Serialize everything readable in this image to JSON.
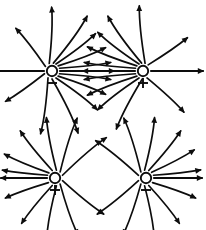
{
  "figure": {
    "background_color": "#ffffff",
    "stroke_color": "#0d0d0d",
    "width": 206,
    "height": 230
  },
  "charges": [
    {
      "id": "charge-top-left",
      "sign": "minus",
      "sign_glyph": "−",
      "label": "negative charge",
      "cx": 52,
      "cy": 71,
      "radius": 5.2,
      "field_direction": "outward",
      "quadrant": "top-left",
      "line_count": 16
    },
    {
      "id": "charge-top-right",
      "sign": "plus",
      "sign_glyph": "+",
      "label": "positive charge",
      "cx": 143,
      "cy": 71,
      "radius": 5.2,
      "field_direction": "outward",
      "quadrant": "top-right",
      "line_count": 13
    },
    {
      "id": "charge-bottom-left",
      "sign": "plus",
      "sign_glyph": "+",
      "label": "positive charge",
      "cx": 55,
      "cy": 178,
      "radius": 5.2,
      "field_direction": "outward",
      "quadrant": "bottom-left",
      "line_count": 12
    },
    {
      "id": "charge-bottom-right",
      "sign": "minus",
      "sign_glyph": "−",
      "label": "negative charge",
      "cx": 146,
      "cy": 178,
      "radius": 5.2,
      "field_direction": "outward",
      "quadrant": "bottom-right",
      "line_count": 12
    }
  ],
  "chart_data": {
    "type": "diagram",
    "series": [
      {
        "name": "top-left negative charge field lines",
        "charge_sign": "minus",
        "center": [
          52,
          71
        ],
        "arrow_direction": "outward",
        "lines": [
          {
            "angle_deg": 180,
            "curvature": 0,
            "length": 50
          },
          {
            "angle_deg": 0,
            "curvature": 0,
            "length": 54
          },
          {
            "angle_deg": 20,
            "curvature": 0.35,
            "length": 50
          },
          {
            "angle_deg": 40,
            "curvature": 0.5,
            "length": 48
          },
          {
            "angle_deg": 60,
            "curvature": 0.6,
            "length": 46
          },
          {
            "angle_deg": 80,
            "curvature": 0.7,
            "length": 52
          },
          {
            "angle_deg": 110,
            "curvature": 0.6,
            "length": 52
          },
          {
            "angle_deg": 145,
            "curvature": 0.45,
            "length": 46
          },
          {
            "angle_deg": 200,
            "curvature": -0.4,
            "length": 46
          },
          {
            "angle_deg": 240,
            "curvature": -0.6,
            "length": 52
          },
          {
            "angle_deg": 270,
            "curvature": -0.7,
            "length": 54
          },
          {
            "angle_deg": 300,
            "curvature": -0.6,
            "length": 48
          },
          {
            "angle_deg": 320,
            "curvature": -0.5,
            "length": 48
          },
          {
            "angle_deg": 340,
            "curvature": -0.35,
            "length": 50
          }
        ]
      },
      {
        "name": "top-right positive charge field lines",
        "charge_sign": "plus",
        "center": [
          143,
          71
        ],
        "arrow_direction": "outward",
        "lines": [
          {
            "angle_deg": 0,
            "curvature": 0,
            "length": 52
          },
          {
            "angle_deg": 180,
            "curvature": 0,
            "length": 52
          },
          {
            "angle_deg": 160,
            "curvature": -0.35,
            "length": 50
          },
          {
            "angle_deg": 140,
            "curvature": -0.5,
            "length": 50
          },
          {
            "angle_deg": 120,
            "curvature": -0.6,
            "length": 48
          },
          {
            "angle_deg": 100,
            "curvature": -0.7,
            "length": 52
          },
          {
            "angle_deg": 75,
            "curvature": -0.55,
            "length": 54
          },
          {
            "angle_deg": 50,
            "curvature": 0.4,
            "length": 46
          },
          {
            "angle_deg": 200,
            "curvature": 0.35,
            "length": 50
          },
          {
            "angle_deg": 220,
            "curvature": 0.5,
            "length": 50
          },
          {
            "angle_deg": 240,
            "curvature": 0.6,
            "length": 48
          },
          {
            "angle_deg": 265,
            "curvature": 0.6,
            "length": 52
          },
          {
            "angle_deg": 300,
            "curvature": -0.45,
            "length": 48
          }
        ]
      },
      {
        "name": "bottom-left positive charge field lines",
        "charge_sign": "plus",
        "center": [
          55,
          178
        ],
        "arrow_direction": "outward",
        "lines": [
          {
            "angle_deg": 180,
            "curvature": 0,
            "length": 46
          },
          {
            "angle_deg": 160,
            "curvature": -0.35,
            "length": 44
          },
          {
            "angle_deg": 140,
            "curvature": -0.45,
            "length": 46
          },
          {
            "angle_deg": 110,
            "curvature": -0.5,
            "length": 48
          },
          {
            "angle_deg": 80,
            "curvature": -0.55,
            "length": 50
          },
          {
            "angle_deg": 50,
            "curvature": -0.6,
            "length": 52
          },
          {
            "angle_deg": 20,
            "curvature": -0.55,
            "length": 54
          },
          {
            "angle_deg": 340,
            "curvature": 0.5,
            "length": 50
          },
          {
            "angle_deg": 310,
            "curvature": 0.55,
            "length": 50
          },
          {
            "angle_deg": 280,
            "curvature": 0.55,
            "length": 48
          },
          {
            "angle_deg": 250,
            "curvature": 0.5,
            "length": 46
          },
          {
            "angle_deg": 215,
            "curvature": 0.4,
            "length": 44
          }
        ]
      },
      {
        "name": "bottom-right negative charge field lines",
        "charge_sign": "minus",
        "center": [
          146,
          178
        ],
        "arrow_direction": "outward",
        "lines": [
          {
            "angle_deg": 0,
            "curvature": 0,
            "length": 48
          },
          {
            "angle_deg": 20,
            "curvature": 0.35,
            "length": 46
          },
          {
            "angle_deg": 45,
            "curvature": 0.45,
            "length": 46
          },
          {
            "angle_deg": 70,
            "curvature": 0.5,
            "length": 48
          },
          {
            "angle_deg": 100,
            "curvature": 0.55,
            "length": 50
          },
          {
            "angle_deg": 130,
            "curvature": 0.6,
            "length": 52
          },
          {
            "angle_deg": 160,
            "curvature": 0.5,
            "length": 52
          },
          {
            "angle_deg": 200,
            "curvature": -0.5,
            "length": 50
          },
          {
            "angle_deg": 230,
            "curvature": -0.55,
            "length": 50
          },
          {
            "angle_deg": 260,
            "curvature": -0.55,
            "length": 48
          },
          {
            "angle_deg": 290,
            "curvature": -0.5,
            "length": 46
          },
          {
            "angle_deg": 325,
            "curvature": -0.4,
            "length": 44
          }
        ]
      }
    ]
  }
}
